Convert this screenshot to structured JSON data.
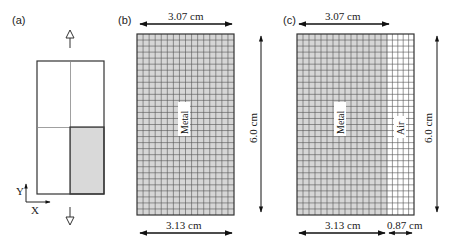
{
  "figure": {
    "panels": [
      {
        "id": "a",
        "label": "(a)",
        "axis": {
          "x_label": "X",
          "y_label": "Y"
        },
        "description": "Unit cell split into four quadrants; lower-right quadrant shaded, hollow arrows above and below"
      },
      {
        "id": "b",
        "label": "(b)",
        "top_dimension": "3.07 cm",
        "bottom_dimension": "3.13 cm",
        "height_dimension": "6.0 cm",
        "regions": [
          {
            "name": "Metal",
            "columns": 16
          }
        ],
        "rows": 30
      },
      {
        "id": "c",
        "label": "(c)",
        "top_dimension": "3.07 cm",
        "bottom_dimension_metal": "3.13 cm",
        "bottom_dimension_air": "0.87 cm",
        "height_dimension": "6.0 cm",
        "regions": [
          {
            "name": "Metal",
            "columns": 15
          },
          {
            "name": "Air",
            "columns": 5
          }
        ],
        "rows": 30
      }
    ],
    "colors": {
      "metal_fill": "#d6d6d6",
      "air_fill": "#ffffff",
      "grid_line": "#555555",
      "shade_fill": "#d9d9d9"
    }
  }
}
